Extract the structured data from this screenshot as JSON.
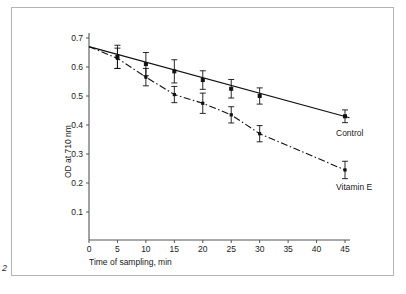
{
  "figure": {
    "number": "2",
    "border_color": "#b4b4b4",
    "background": "#ffffff"
  },
  "axes": {
    "y_title": "OD at 710 nm",
    "x_title": "Time of sampling, min"
  },
  "labels": {
    "control": "Control",
    "vitamin_e": "Vitamin E"
  },
  "chart_data": {
    "type": "line",
    "title": "",
    "subtitle": "",
    "xlabel": "Time of sampling, min",
    "ylabel": "OD at 710 nm",
    "xlim": [
      0,
      47
    ],
    "ylim": [
      0,
      0.72
    ],
    "xticks": [
      0,
      5,
      10,
      15,
      20,
      25,
      30,
      35,
      40,
      45
    ],
    "xtick_labels": [
      "0",
      "5",
      "10",
      "15",
      "20",
      "25",
      "30",
      "35",
      "40",
      "45"
    ],
    "yticks": [
      0.1,
      0.2,
      0.3,
      0.4,
      0.5,
      0.6,
      0.7
    ],
    "ytick_labels": [
      "0.1",
      "0.2",
      "0.3",
      "0.4",
      "0.5",
      "0.6",
      "0.7"
    ],
    "grid": false,
    "legend_position": "inline-right-annotations",
    "series": [
      {
        "name": "Control",
        "line_style": "solid",
        "marker": "square",
        "x": [
          0,
          5,
          10,
          15,
          20,
          25,
          30,
          45
        ],
        "values": [
          0.67,
          0.635,
          0.61,
          0.585,
          0.555,
          0.525,
          0.5,
          0.43
        ],
        "error": [
          0.0,
          0.04,
          0.04,
          0.04,
          0.032,
          0.032,
          0.028,
          0.022
        ],
        "trend_start": [
          0,
          0.67
        ],
        "trend_end": [
          45.8,
          0.425
        ],
        "annotation": "Control"
      },
      {
        "name": "Vitamin E",
        "line_style": "dash-dot",
        "marker": "square-small",
        "x": [
          0,
          5,
          10,
          15,
          20,
          25,
          30,
          45
        ],
        "values": [
          0.67,
          0.63,
          0.565,
          0.505,
          0.475,
          0.435,
          0.37,
          0.245
        ],
        "error": [
          0.0,
          0.035,
          0.03,
          0.028,
          0.035,
          0.028,
          0.028,
          0.03
        ],
        "annotation": "Vitamin E"
      }
    ]
  }
}
